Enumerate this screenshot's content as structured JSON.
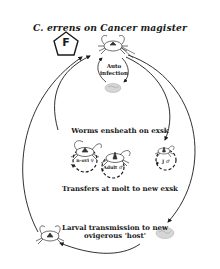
{
  "title": "C. errens on Cancer magister",
  "badge": {
    "letter": "F",
    "shape": "pentagon"
  },
  "labels": {
    "auto_infection": "Auto infection",
    "ensheath": "Worms ensheath on exsk",
    "transfer": "Transfers at molt to new exsk",
    "larval": "Larval transmission to new ovigerous 'host'"
  },
  "stages": [
    {
      "id": "non-ovigerous-female",
      "label": "n-ovi ♀"
    },
    {
      "id": "adult-male",
      "label": "Adult ♂"
    },
    {
      "id": "juvenile-male",
      "label": "J ♂"
    }
  ],
  "icons": {
    "ovigerous_crab": "crab-icon",
    "egg_mass_top": "egg-mass-icon",
    "egg_mass_bottom": "egg-mass-icon",
    "larval_crab": "crab-icon"
  },
  "colors": {
    "line": "#1a1a1a",
    "background": "#ffffff",
    "egg": "#c8c8c8"
  }
}
